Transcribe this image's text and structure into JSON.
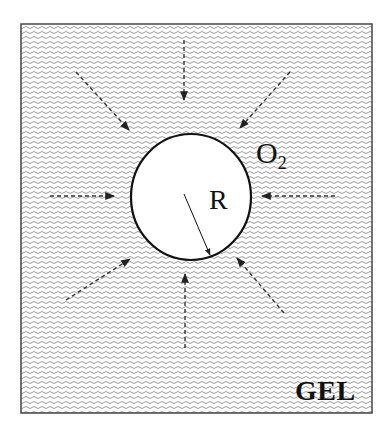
{
  "diagram": {
    "region_label": "GEL",
    "species_label": "O",
    "species_subscript": "2",
    "radius_label": "R",
    "arrows": 8,
    "colors": {
      "border": "#333333",
      "hatch": "#9a9a9a",
      "circle": "#111111",
      "arrow": "#333333"
    }
  }
}
